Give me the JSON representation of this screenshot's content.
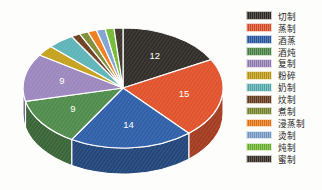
{
  "chart_data": {
    "type": "pie",
    "title": "",
    "subtitle": "",
    "xlabel": "",
    "ylabel": "",
    "legend_position": "right",
    "grid": false,
    "three_d": true,
    "categories": [
      "切制",
      "蒸制",
      "酒蒸",
      "酒炖",
      "复制",
      "粉碎",
      "奶制",
      "炆制",
      "煮制",
      "浸蒸制",
      "烫制",
      "炖制",
      "蜜制"
    ],
    "values": [
      12,
      15,
      14,
      9,
      9,
      2,
      3,
      1,
      1,
      1,
      1,
      1,
      1
    ],
    "colors": [
      "#2f2b26",
      "#e1512a",
      "#2d5ea8",
      "#4e8b4a",
      "#9b86bd",
      "#c4a01a",
      "#5cb3b6",
      "#6b3e20",
      "#7f8b33",
      "#ef7b18",
      "#7ea3cf",
      "#73ba33",
      "#3b3229"
    ],
    "labels_shown": [
      "12",
      "15",
      "14",
      "9",
      "9",
      "2",
      "3",
      "1",
      "1",
      "1",
      "1",
      "1",
      "1"
    ],
    "slice_label_color": "#ffffff"
  },
  "legend": {
    "items": [
      {
        "label": "切制",
        "value": 12,
        "color": "#2f2b26"
      },
      {
        "label": "蒸制",
        "value": 15,
        "color": "#e1512a"
      },
      {
        "label": "酒蒸",
        "value": 14,
        "color": "#2d5ea8"
      },
      {
        "label": "酒炖",
        "value": 9,
        "color": "#4e8b4a"
      },
      {
        "label": "复制",
        "value": 9,
        "color": "#9b86bd"
      },
      {
        "label": "粉碎",
        "value": 2,
        "color": "#c4a01a"
      },
      {
        "label": "奶制",
        "value": 3,
        "color": "#5cb3b6"
      },
      {
        "label": "炆制",
        "value": 1,
        "color": "#6b3e20"
      },
      {
        "label": "煮制",
        "value": 1,
        "color": "#7f8b33"
      },
      {
        "label": "浸蒸制",
        "value": 1,
        "color": "#ef7b18"
      },
      {
        "label": "烫制",
        "value": 1,
        "color": "#7ea3cf"
      },
      {
        "label": "炖制",
        "value": 1,
        "color": "#73ba33"
      },
      {
        "label": "蜜制",
        "value": 1,
        "color": "#3b3229"
      }
    ]
  }
}
